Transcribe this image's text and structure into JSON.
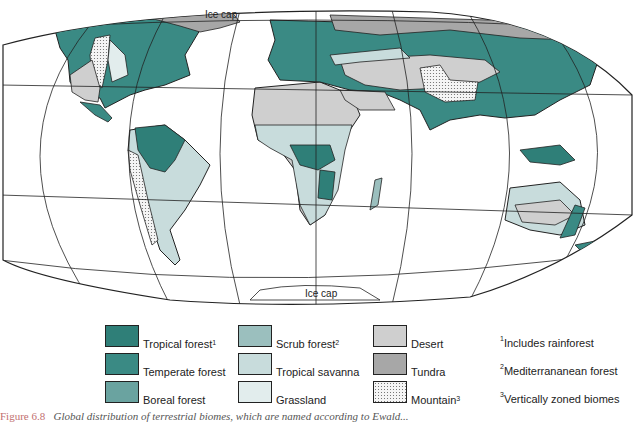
{
  "map": {
    "labels": {
      "ice_cap_north": "Ice cap",
      "ice_cap_south": "Ice cap"
    }
  },
  "legend": {
    "items": [
      {
        "label": "Tropical forest",
        "sup": "1",
        "color": "#2f7f78"
      },
      {
        "label": "Temperate forest",
        "sup": "",
        "color": "#3a8a84"
      },
      {
        "label": "Boreal forest",
        "sup": "",
        "color": "#6aa3a0"
      },
      {
        "label": "Scrub forest",
        "sup": "2",
        "color": "#9bbfbe"
      },
      {
        "label": "Tropical savanna",
        "sup": "",
        "color": "#c8dcdc"
      },
      {
        "label": "Grassland",
        "sup": "",
        "color": "#e2eded"
      },
      {
        "label": "Desert",
        "sup": "",
        "color": "#cfcfcf"
      },
      {
        "label": "Tundra",
        "sup": "",
        "color": "#a7a7a7"
      },
      {
        "label": "Mountain",
        "sup": "3",
        "color": "dotted"
      }
    ],
    "notes": [
      {
        "sup": "1",
        "text": "Includes rainforest"
      },
      {
        "sup": "2",
        "text": "Mediterrananean forest"
      },
      {
        "sup": "3",
        "text": "Vertically zoned biomes"
      }
    ]
  },
  "caption": {
    "number": "Figure 6.8",
    "text": "Global distribution of terrestrial biomes, which are named according to Ewald..."
  }
}
